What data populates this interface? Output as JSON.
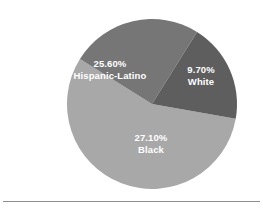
{
  "chart_data": {
    "type": "pie",
    "title": "",
    "subtitle": "",
    "xlabel": "",
    "ylabel": "",
    "grid": false,
    "legend_position": "none",
    "labels_inside_slices": true,
    "categories": [
      "Hispanic-Latino",
      "White",
      "Black"
    ],
    "values": [
      25.6,
      27.1,
      9.7
    ],
    "value_unit": "%",
    "slices": [
      {
        "name": "Hispanic-Latino",
        "percent_text": "25.60%",
        "value": 25.6,
        "color": "#767676",
        "label_color": "#ffffff",
        "start_angle_deg": 212,
        "end_angle_deg": 302
      },
      {
        "name": "White",
        "percent_text": "9.70%",
        "value": 9.7,
        "color": "#5e5e5e",
        "label_color": "#ffffff",
        "start_angle_deg": 302,
        "end_angle_deg": 370
      },
      {
        "name": "Black",
        "percent_text": "27.10%",
        "value": 27.1,
        "color": "#a8a8a8",
        "label_color": "#ffffff",
        "start_angle_deg": 10,
        "end_angle_deg": 212
      }
    ],
    "geometry": {
      "center_x": 152,
      "center_y": 104,
      "radius": 85
    },
    "background_color": "#ffffff",
    "rule_color": "#8d8d8d"
  },
  "figure": {
    "slice_hispanic_latino": {
      "percent": "25.60%",
      "name": "Hispanic-Latino"
    },
    "slice_white": {
      "percent": "9.70%",
      "name": "White"
    },
    "slice_black": {
      "percent": "27.10%",
      "name": "Black"
    }
  }
}
